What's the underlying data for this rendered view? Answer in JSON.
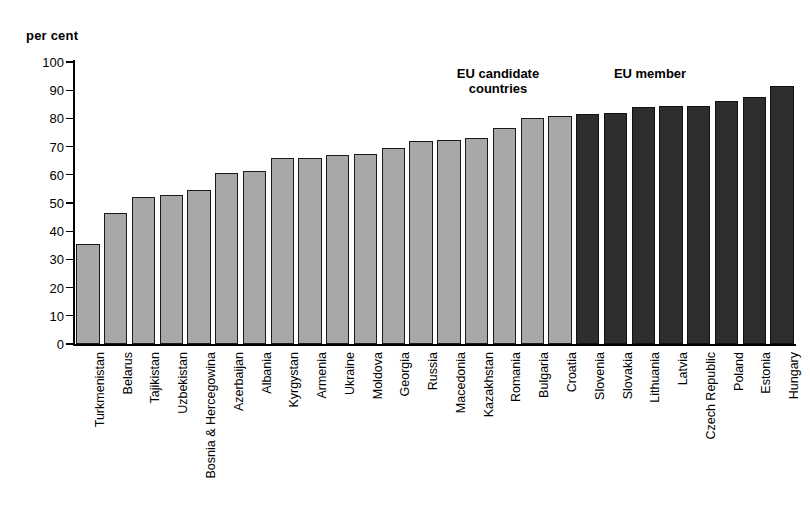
{
  "axis": {
    "unit_label": "per cent",
    "y_ticks": [
      0,
      10,
      20,
      30,
      40,
      50,
      60,
      70,
      80,
      90,
      100
    ]
  },
  "annotations": {
    "candidate_line1": "EU candidate",
    "candidate_line2": "countries",
    "member": "EU member"
  },
  "colors": {
    "light_bar": "#a8a8a8",
    "dark_bar": "#2e2e2e",
    "axis": "#000000",
    "background": "#ffffff"
  },
  "chart_data": {
    "type": "bar",
    "title": "",
    "xlabel": "",
    "ylabel": "per cent",
    "ylim": [
      0,
      100
    ],
    "grid": false,
    "legend_position": "none",
    "categories": [
      "Turkmenistan",
      "Belarus",
      "Tajikistan",
      "Uzbekistan",
      "Bosnia & Hercegowina",
      "Azerbaijan",
      "Albania",
      "Kyrgystan",
      "Armenia",
      "Ukraine",
      "Moldova",
      "Georgia",
      "Russia",
      "Macedonia",
      "Kazakhstan",
      "Romania",
      "Bulgaria",
      "Croatia",
      "Slovenia",
      "Slovakia",
      "Lithuania",
      "Latvia",
      "Czech Republic",
      "Poland",
      "Estonia",
      "Hungary"
    ],
    "values": [
      35.5,
      46.5,
      52.0,
      53.0,
      54.5,
      60.5,
      61.5,
      66.0,
      66.0,
      67.0,
      67.5,
      69.5,
      72.0,
      72.5,
      73.0,
      76.5,
      80.0,
      81.0,
      81.5,
      82.0,
      84.0,
      84.5,
      84.5,
      86.0,
      87.5,
      91.5
    ],
    "bar_groups": [
      "other",
      "other",
      "other",
      "other",
      "other",
      "other",
      "other",
      "other",
      "other",
      "other",
      "other",
      "other",
      "other",
      "other",
      "other",
      "candidate",
      "candidate",
      "candidate",
      "member",
      "member",
      "member",
      "member",
      "member",
      "member",
      "member",
      "member"
    ]
  }
}
